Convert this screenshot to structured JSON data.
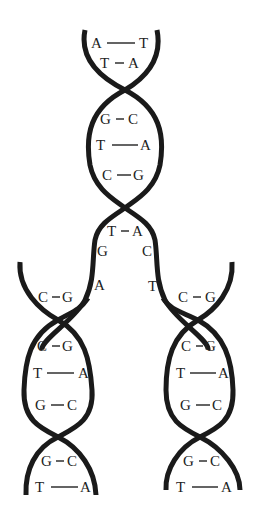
{
  "diagram": {
    "parent_helix": {
      "pairs": [
        {
          "left": "A",
          "right": "T",
          "bond": "long"
        },
        {
          "left": "T",
          "right": "A",
          "bond": "short"
        },
        {
          "left": "G",
          "right": "C",
          "bond": "short"
        },
        {
          "left": "T",
          "right": "A",
          "bond": "long"
        },
        {
          "left": "C",
          "right": "G",
          "bond": "short"
        },
        {
          "left": "T",
          "right": "A",
          "bond": "short"
        }
      ]
    },
    "unpaired_bases": {
      "left_strand": [
        "G",
        "A"
      ],
      "right_strand": [
        "C",
        "T"
      ]
    },
    "daughter_left": {
      "pairs": [
        {
          "left": "C",
          "right": "G"
        },
        {
          "left": "C",
          "right": "G"
        },
        {
          "left": "T",
          "right": "A"
        },
        {
          "left": "G",
          "right": "C"
        },
        {
          "left": "G",
          "right": "C"
        },
        {
          "left": "T",
          "right": "A"
        }
      ]
    },
    "daughter_right": {
      "pairs": [
        {
          "left": "C",
          "right": "G"
        },
        {
          "left": "C",
          "right": "G"
        },
        {
          "left": "T",
          "right": "A"
        },
        {
          "left": "G",
          "right": "C"
        },
        {
          "left": "G",
          "right": "C"
        },
        {
          "left": "T",
          "right": "A"
        }
      ]
    },
    "colors": {
      "strand": "#1a1a1a",
      "text": "#222222",
      "background": "#ffffff"
    }
  }
}
